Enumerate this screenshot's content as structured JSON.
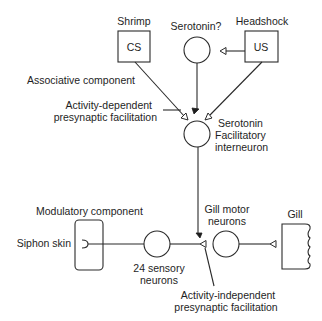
{
  "diagram": {
    "stimuli": {
      "cs": {
        "caption": "Shrimp",
        "label": "CS"
      },
      "modulator": {
        "caption": "Serotonin?"
      },
      "us": {
        "caption": "Headshock",
        "label": "US"
      }
    },
    "sections": {
      "associative": "Associative component",
      "modulatory": "Modulatory component"
    },
    "annotations": {
      "activity_dependent": [
        "Activity-dependent",
        "presynaptic facilitation"
      ],
      "activity_independent": [
        "Activity-independent",
        "presynaptic facilitation"
      ]
    },
    "neurons": {
      "interneuron": [
        "Serotonin",
        "Facilitatory",
        "interneuron"
      ],
      "sensory": [
        "24 sensory",
        "neurons"
      ],
      "motor": [
        "Gill motor",
        "neurons"
      ]
    },
    "organs": {
      "siphon": "Siphon skin",
      "gill": "Gill"
    },
    "colors": {
      "line": "#2a2a2a",
      "text": "#1e1e1e",
      "background": "#ffffff"
    }
  }
}
